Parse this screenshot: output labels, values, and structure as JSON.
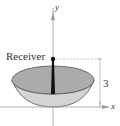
{
  "figure": {
    "receiver_label": "Receiver",
    "y_axis_label": "y",
    "x_axis_label": "x",
    "height_dimension_label": "3"
  },
  "colors": {
    "bowl_inner_rim": "#a8a8a8",
    "bowl_outer": "#d0d0d0",
    "receiver_post": "#111111",
    "axes": "#999999",
    "dimension_lines": "#aaaaaa"
  }
}
